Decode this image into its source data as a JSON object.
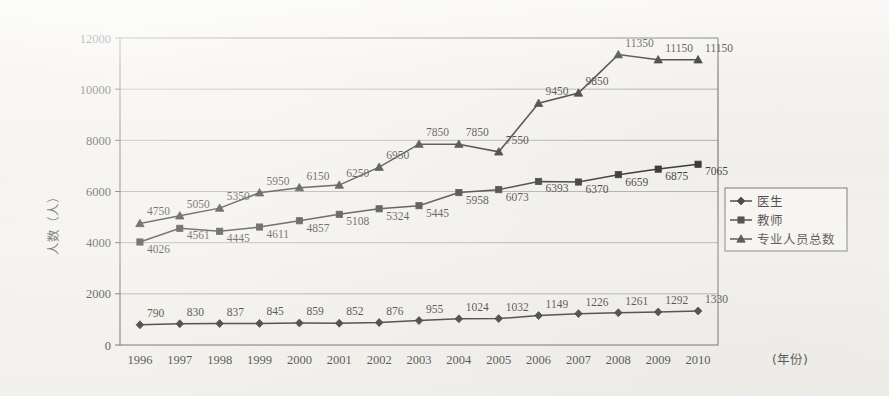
{
  "chart_data": {
    "type": "line",
    "title": "",
    "xlabel": "(年份)",
    "ylabel": "人数（人）",
    "ylim": [
      0,
      12000
    ],
    "ytick_step": 2000,
    "yticks": [
      "0",
      "2000",
      "4000",
      "6000",
      "8000",
      "10000",
      "12000"
    ],
    "grid": "horizontal",
    "legend_position": "right-middle",
    "categories": [
      "1996",
      "1997",
      "1998",
      "1999",
      "2000",
      "2001",
      "2002",
      "2003",
      "2004",
      "2005",
      "2006",
      "2007",
      "2008",
      "2009",
      "2010"
    ],
    "series": [
      {
        "name": "医生",
        "marker": "diamond",
        "values": [
          790,
          830,
          837,
          845,
          859,
          852,
          876,
          955,
          1024,
          1032,
          1149,
          1226,
          1261,
          1292,
          1330
        ],
        "labels": [
          "790",
          "830",
          "837",
          "845",
          "859",
          "852",
          "876",
          "955",
          "1024",
          "1032",
          "1149",
          "1226",
          "1261",
          "1292",
          "1330"
        ]
      },
      {
        "name": "教师",
        "marker": "square",
        "values": [
          4026,
          4561,
          4445,
          4611,
          4857,
          5108,
          5324,
          5445,
          5958,
          6073,
          6393,
          6370,
          6659,
          6875,
          7065
        ],
        "labels": [
          "4026",
          "4561",
          "4445",
          "4611",
          "4857",
          "5108",
          "5324",
          "5445",
          "5958",
          "6073",
          "6393",
          "6370",
          "6659",
          "6875",
          "7065"
        ]
      },
      {
        "name": "专业人员总数",
        "marker": "triangle",
        "values": [
          4750,
          5050,
          5350,
          5950,
          6150,
          6250,
          6950,
          7850,
          7850,
          7550,
          9450,
          9850,
          11350,
          11150,
          11150
        ],
        "labels": [
          "4750",
          "5050",
          "5350",
          "5950",
          "6150",
          "6250",
          "6950",
          "7850",
          "7850",
          "7550",
          "9450",
          "9850",
          "11350",
          "11150",
          "11150"
        ]
      }
    ]
  },
  "axes": {
    "y_axis_title": "人数（人）",
    "x_axis_title": "(年份)",
    "y_tick_labels": [
      "12000",
      "10000",
      "8000",
      "6000",
      "4000",
      "2000",
      "0"
    ],
    "x_tick_labels": [
      "1996",
      "1997",
      "1998",
      "1999",
      "2000",
      "2001",
      "2002",
      "2003",
      "2004",
      "2005",
      "2006",
      "2007",
      "2008",
      "2009",
      "2010"
    ]
  },
  "legend": {
    "items": [
      {
        "label": "医生",
        "marker": "diamond"
      },
      {
        "label": "教师",
        "marker": "square"
      },
      {
        "label": "专业人员总数",
        "marker": "triangle"
      }
    ]
  },
  "colors": {
    "line": "#121212",
    "grid": "#8d8d8d",
    "frame": "#4a4a4a",
    "background": "#f4f2ee",
    "text": "#1f1f1f"
  }
}
